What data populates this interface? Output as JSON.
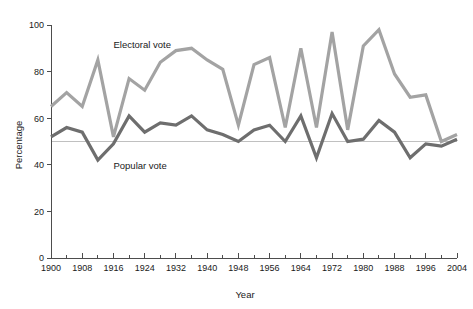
{
  "chart_data": {
    "type": "line",
    "title": "",
    "xlabel": "Year",
    "ylabel": "Percentage",
    "xlim": [
      1900,
      2004
    ],
    "ylim": [
      0,
      100
    ],
    "grid": false,
    "reference_line": 50,
    "legend_position": "inline-annotation",
    "y_ticks": [
      0,
      20,
      40,
      60,
      80,
      100
    ],
    "y_tick_labels": [
      "0",
      "20",
      "40",
      "60",
      "80",
      "100"
    ],
    "x_ticks": [
      1900,
      1908,
      1916,
      1924,
      1932,
      1940,
      1948,
      1956,
      1964,
      1972,
      1980,
      1988,
      1996,
      2004
    ],
    "x_tick_labels": [
      "1900",
      "1908",
      "1916",
      "1924",
      "1932",
      "1940",
      "1948",
      "1956",
      "1964",
      "1972",
      "1980",
      "1988",
      "1996",
      "2004"
    ],
    "x_minor_tick_interval": 4,
    "x": [
      1900,
      1904,
      1908,
      1912,
      1916,
      1920,
      1924,
      1928,
      1932,
      1936,
      1940,
      1944,
      1948,
      1952,
      1956,
      1960,
      1964,
      1968,
      1972,
      1976,
      1980,
      1984,
      1988,
      1992,
      1996,
      2000,
      2004
    ],
    "series": [
      {
        "name": "Electoral vote",
        "color": "#a3a3a3",
        "label_x": 1916,
        "label_y": 90,
        "values": [
          65,
          71,
          65,
          85,
          52,
          77,
          72,
          84,
          89,
          90,
          85,
          81,
          57,
          83,
          86,
          56,
          90,
          56,
          97,
          55,
          91,
          98,
          79,
          69,
          70,
          50,
          53
        ]
      },
      {
        "name": "Popular vote",
        "color": "#6e6e6e",
        "label_x": 1916,
        "label_y": 38,
        "values": [
          52,
          56,
          54,
          42,
          49,
          61,
          54,
          58,
          57,
          61,
          55,
          53,
          50,
          55,
          57,
          50,
          61,
          43,
          62,
          50,
          51,
          59,
          54,
          43,
          49,
          48,
          51
        ]
      }
    ]
  }
}
